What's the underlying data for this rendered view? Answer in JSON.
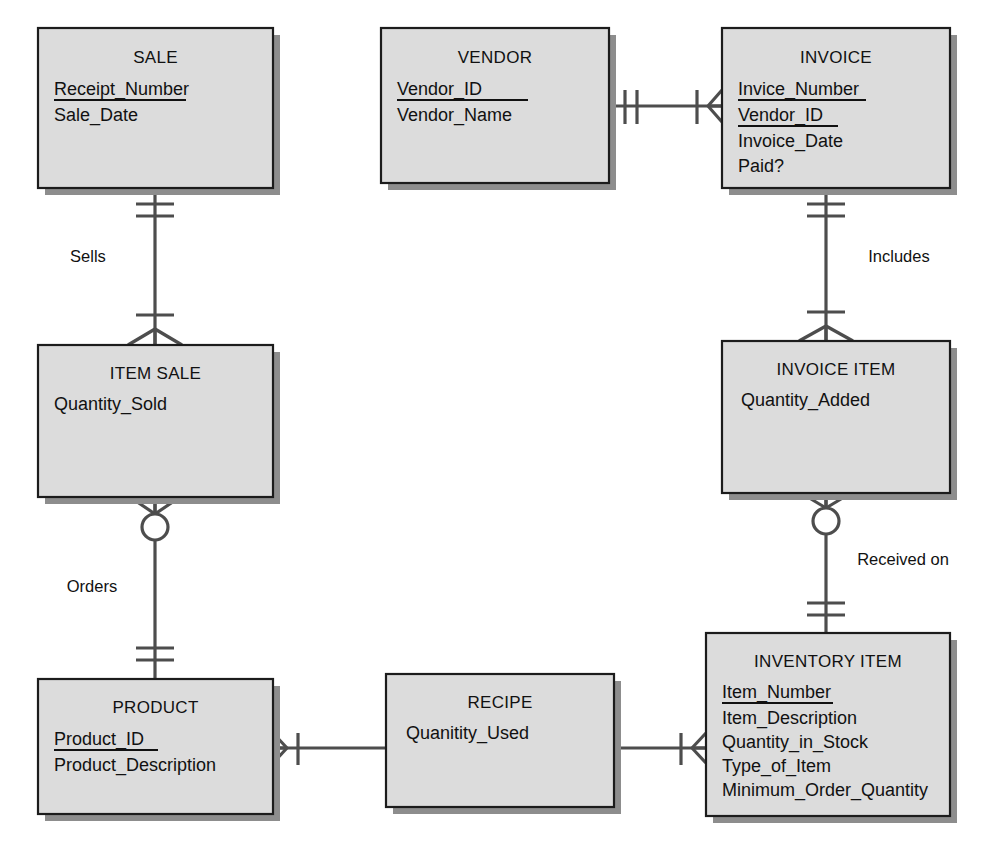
{
  "diagram": {
    "kind": "entity-relationship-diagram",
    "notation": "crows-foot",
    "colors": {
      "entity_fill": "#dcdcdc",
      "entity_border": "#1c1c1c",
      "entity_shadow": "#8d8d8d",
      "connector": "#4d4d4d",
      "text": "#111111",
      "background": "#ffffff"
    },
    "entities": [
      {
        "id": "sale",
        "title": "SALE",
        "x": 38,
        "y": 28,
        "w": 235,
        "h": 160,
        "attributes": [
          {
            "name": "Receipt_Number",
            "key": true
          },
          {
            "name": "Sale_Date",
            "key": false
          }
        ]
      },
      {
        "id": "vendor",
        "title": "VENDOR",
        "x": 381,
        "y": 28,
        "w": 228,
        "h": 155,
        "attributes": [
          {
            "name": "Vendor_ID",
            "key": true
          },
          {
            "name": "Vendor_Name",
            "key": false
          }
        ]
      },
      {
        "id": "invoice",
        "title": "INVOICE",
        "x": 722,
        "y": 28,
        "w": 228,
        "h": 160,
        "attributes": [
          {
            "name": "Invice_Number",
            "key": true
          },
          {
            "name": "Vendor_ID",
            "key": true
          },
          {
            "name": "Invoice_Date",
            "key": false
          },
          {
            "name": "Paid?",
            "key": false
          }
        ]
      },
      {
        "id": "item-sale",
        "title": "ITEM SALE",
        "x": 38,
        "y": 345,
        "w": 235,
        "h": 152,
        "attributes": [
          {
            "name": "Quantity_Sold",
            "key": false
          }
        ]
      },
      {
        "id": "invoice-item",
        "title": "INVOICE ITEM",
        "x": 722,
        "y": 341,
        "w": 228,
        "h": 152,
        "attributes": [
          {
            "name": "Quantity_Added",
            "key": false
          }
        ]
      },
      {
        "id": "product",
        "title": "PRODUCT",
        "x": 38,
        "y": 679,
        "w": 235,
        "h": 135,
        "attributes": [
          {
            "name": "Product_ID",
            "key": true
          },
          {
            "name": "Product_Description",
            "key": false
          }
        ]
      },
      {
        "id": "recipe",
        "title": "RECIPE",
        "x": 386,
        "y": 674,
        "w": 228,
        "h": 133,
        "attributes": [
          {
            "name": "Quanitity_Used",
            "key": false
          }
        ]
      },
      {
        "id": "inventory-item",
        "title": "INVENTORY ITEM",
        "x": 706,
        "y": 633,
        "w": 244,
        "h": 183,
        "attributes": [
          {
            "name": "Item_Number",
            "key": true
          },
          {
            "name": "Item_Description",
            "key": false
          },
          {
            "name": "Quantity_in_Stock",
            "key": false
          },
          {
            "name": "Type_of_Item",
            "key": false
          },
          {
            "name": "Minimum_Order_Quantity",
            "key": false
          }
        ]
      }
    ],
    "relationships": [
      {
        "id": "sells",
        "label": "Sells",
        "from": "sale",
        "to": "item-sale",
        "from_cardinality": "one-and-only-one",
        "to_cardinality": "one-or-many",
        "label_x": 88,
        "label_y": 262
      },
      {
        "id": "orders",
        "label": "Orders",
        "from": "item-sale",
        "to": "product",
        "from_cardinality": "zero-or-many",
        "to_cardinality": "one-and-only-one",
        "label_x": 92,
        "label_y": 592
      },
      {
        "id": "bills",
        "label": "",
        "from": "vendor",
        "to": "invoice",
        "from_cardinality": "one-and-only-one",
        "to_cardinality": "one-or-many",
        "label_x": 665,
        "label_y": 90
      },
      {
        "id": "includes",
        "label": "Includes",
        "from": "invoice",
        "to": "invoice-item",
        "from_cardinality": "one-and-only-one",
        "to_cardinality": "one-or-many",
        "label_x": 899,
        "label_y": 262
      },
      {
        "id": "received-on",
        "label": "Received on",
        "from": "invoice-item",
        "to": "inventory-item",
        "from_cardinality": "zero-or-many",
        "to_cardinality": "one-and-only-one",
        "label_x": 903,
        "label_y": 565
      },
      {
        "id": "recipe-product",
        "label": "",
        "from": "product",
        "to": "recipe",
        "from_cardinality": "one-or-many",
        "to_cardinality": "none",
        "label_x": 330,
        "label_y": 730
      },
      {
        "id": "recipe-inventory",
        "label": "",
        "from": "recipe",
        "to": "inventory-item",
        "from_cardinality": "none",
        "to_cardinality": "one-or-many",
        "label_x": 662,
        "label_y": 730
      }
    ]
  }
}
